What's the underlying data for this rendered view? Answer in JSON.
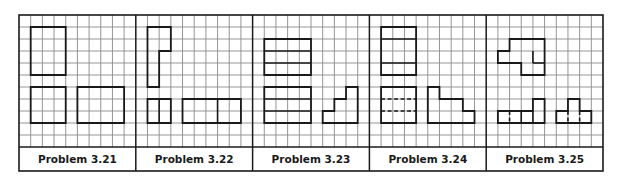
{
  "figure": {
    "colors": {
      "grid": "#8a8a8a",
      "outline": "#1a1a1a",
      "background": "#ffffff"
    },
    "grid": {
      "cols_per_panel": 10,
      "rows": 11
    },
    "panels": [
      {
        "label": "Problem 3.21",
        "shapes": [
          {
            "type": "poly",
            "points": [
              [
                1,
                1
              ],
              [
                4,
                1
              ],
              [
                4,
                5
              ],
              [
                1,
                5
              ]
            ]
          },
          {
            "type": "poly",
            "points": [
              [
                1,
                6
              ],
              [
                4,
                6
              ],
              [
                4,
                9
              ],
              [
                1,
                9
              ]
            ]
          },
          {
            "type": "poly",
            "points": [
              [
                5,
                6
              ],
              [
                9,
                6
              ],
              [
                9,
                9
              ],
              [
                5,
                9
              ]
            ]
          }
        ],
        "lines": []
      },
      {
        "label": "Problem 3.22",
        "shapes": [
          {
            "type": "poly",
            "points": [
              [
                1,
                1
              ],
              [
                3,
                1
              ],
              [
                3,
                3
              ],
              [
                2,
                3
              ],
              [
                2,
                6
              ],
              [
                1,
                6
              ]
            ]
          },
          {
            "type": "poly",
            "points": [
              [
                1,
                7
              ],
              [
                3,
                7
              ],
              [
                3,
                9
              ],
              [
                1,
                9
              ]
            ]
          },
          {
            "type": "poly",
            "points": [
              [
                4,
                7
              ],
              [
                9,
                7
              ],
              [
                9,
                9
              ],
              [
                4,
                9
              ]
            ]
          }
        ],
        "lines": [
          {
            "from": [
              2,
              7
            ],
            "to": [
              2,
              9
            ],
            "dashed": false
          },
          {
            "from": [
              7,
              7
            ],
            "to": [
              7,
              9
            ],
            "dashed": false
          }
        ]
      },
      {
        "label": "Problem 3.23",
        "shapes": [
          {
            "type": "poly",
            "points": [
              [
                1,
                2
              ],
              [
                5,
                2
              ],
              [
                5,
                5
              ],
              [
                1,
                5
              ]
            ]
          },
          {
            "type": "poly",
            "points": [
              [
                1,
                6
              ],
              [
                5,
                6
              ],
              [
                5,
                9
              ],
              [
                1,
                9
              ]
            ]
          },
          {
            "type": "poly",
            "points": [
              [
                6,
                9
              ],
              [
                6,
                8
              ],
              [
                7,
                8
              ],
              [
                7,
                7
              ],
              [
                8,
                7
              ],
              [
                8,
                6
              ],
              [
                9,
                6
              ],
              [
                9,
                9
              ]
            ]
          }
        ],
        "lines": [
          {
            "from": [
              1,
              3
            ],
            "to": [
              5,
              3
            ],
            "dashed": false
          },
          {
            "from": [
              1,
              4
            ],
            "to": [
              5,
              4
            ],
            "dashed": false
          },
          {
            "from": [
              1,
              7
            ],
            "to": [
              5,
              7
            ],
            "dashed": false
          },
          {
            "from": [
              1,
              8
            ],
            "to": [
              5,
              8
            ],
            "dashed": false
          }
        ]
      },
      {
        "label": "Problem 3.24",
        "shapes": [
          {
            "type": "poly",
            "points": [
              [
                1,
                1
              ],
              [
                4,
                1
              ],
              [
                4,
                5
              ],
              [
                1,
                5
              ]
            ]
          },
          {
            "type": "poly",
            "points": [
              [
                1,
                6
              ],
              [
                4,
                6
              ],
              [
                4,
                9
              ],
              [
                1,
                9
              ]
            ]
          },
          {
            "type": "poly",
            "points": [
              [
                5,
                6
              ],
              [
                6,
                6
              ],
              [
                6,
                7
              ],
              [
                8,
                7
              ],
              [
                8,
                8
              ],
              [
                9,
                8
              ],
              [
                9,
                9
              ],
              [
                5,
                9
              ]
            ]
          }
        ],
        "lines": [
          {
            "from": [
              1,
              2
            ],
            "to": [
              4,
              2
            ],
            "dashed": false
          },
          {
            "from": [
              1,
              4
            ],
            "to": [
              4,
              4
            ],
            "dashed": false
          },
          {
            "from": [
              1,
              7
            ],
            "to": [
              4,
              7
            ],
            "dashed": true
          },
          {
            "from": [
              1,
              8
            ],
            "to": [
              4,
              8
            ],
            "dashed": true
          }
        ]
      },
      {
        "label": "Problem 3.25",
        "shapes": [
          {
            "type": "poly",
            "points": [
              [
                2,
                2
              ],
              [
                5,
                2
              ],
              [
                5,
                5
              ],
              [
                3,
                5
              ],
              [
                3,
                4
              ],
              [
                1,
                4
              ],
              [
                1,
                3
              ],
              [
                2,
                3
              ]
            ]
          },
          {
            "type": "poly",
            "points": [
              [
                1,
                8
              ],
              [
                4,
                8
              ],
              [
                4,
                7
              ],
              [
                5,
                7
              ],
              [
                5,
                9
              ],
              [
                1,
                9
              ]
            ]
          },
          {
            "type": "poly",
            "points": [
              [
                6,
                8
              ],
              [
                7,
                8
              ],
              [
                7,
                7
              ],
              [
                8,
                7
              ],
              [
                8,
                8
              ],
              [
                9,
                8
              ],
              [
                9,
                9
              ],
              [
                6,
                9
              ]
            ]
          }
        ],
        "lines": [
          {
            "from": [
              4,
              3
            ],
            "to": [
              4,
              4
            ],
            "dashed": false
          },
          {
            "from": [
              4,
              4
            ],
            "to": [
              5,
              4
            ],
            "dashed": false
          },
          {
            "from": [
              2,
              8
            ],
            "to": [
              2,
              9
            ],
            "dashed": true
          },
          {
            "from": [
              3,
              8
            ],
            "to": [
              3,
              9
            ],
            "dashed": false
          },
          {
            "from": [
              4,
              8
            ],
            "to": [
              4,
              9
            ],
            "dashed": false
          },
          {
            "from": [
              7,
              8
            ],
            "to": [
              7,
              9
            ],
            "dashed": true
          },
          {
            "from": [
              8,
              8
            ],
            "to": [
              8,
              9
            ],
            "dashed": true
          }
        ]
      }
    ]
  }
}
